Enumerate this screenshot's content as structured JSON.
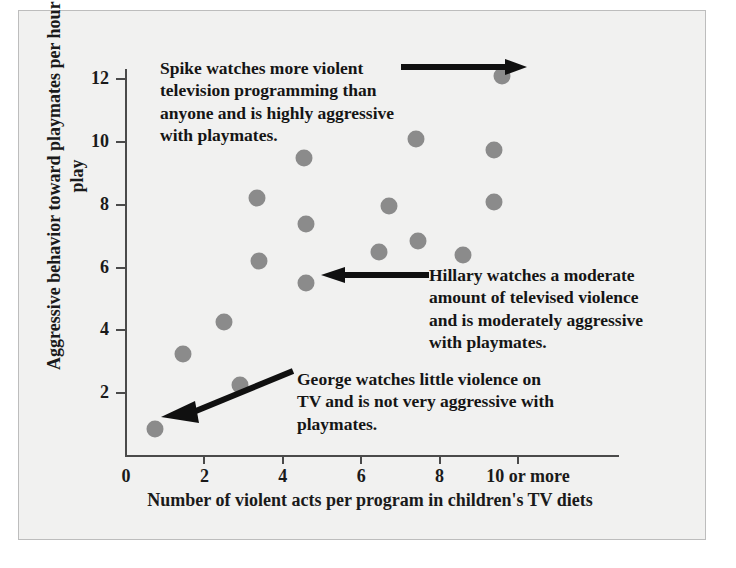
{
  "figure": {
    "background_color": "#f1f1f0",
    "border_color": "#bdbdbd",
    "point_color": "#8b8b8b",
    "axis_color": "#4a4a4a"
  },
  "axes": {
    "y_title": "Aggressive behavior toward playmates\nper hour of play",
    "x_title": "Number of violent acts per program in\nchildren's TV diets",
    "y_ticks": [
      "2",
      "4",
      "6",
      "8",
      "10",
      "12"
    ],
    "x_ticks": [
      "0",
      "2",
      "4",
      "6",
      "8",
      "10 or more"
    ]
  },
  "annotations": {
    "spike": {
      "text": "Spike watches more violent\ntelevision programming than\nanyone and is highly aggressive\nwith playmates.",
      "target_point": "spike-point"
    },
    "hillary": {
      "text": "Hillary watches a moderate\namount of televised violence\nand is moderately aggressive\nwith playmates.",
      "target_point": "hillary-point"
    },
    "george": {
      "text": "George watches little violence on\nTV and is not very aggressive with\nplaymates.",
      "target_point": "george-point"
    }
  },
  "chart_data": {
    "type": "scatter",
    "title": "",
    "xlabel": "Number of violent acts per program in children's TV diets",
    "ylabel": "Aggressive behavior toward playmates per hour of play",
    "xlim": [
      0,
      10.6
    ],
    "ylim": [
      0,
      12.6
    ],
    "xticks": [
      0,
      2,
      4,
      6,
      8,
      10
    ],
    "xticklabels": [
      "0",
      "2",
      "4",
      "6",
      "8",
      "10 or more"
    ],
    "yticks": [
      2,
      4,
      6,
      8,
      10,
      12
    ],
    "yticklabels": [
      "2",
      "4",
      "6",
      "8",
      "10",
      "12"
    ],
    "grid": false,
    "legend": null,
    "marker_color": "#8b8b8b",
    "points": [
      {
        "x": 0.75,
        "y": 0.85,
        "label": "George"
      },
      {
        "x": 1.45,
        "y": 3.25,
        "label": ""
      },
      {
        "x": 2.5,
        "y": 4.25,
        "label": ""
      },
      {
        "x": 2.9,
        "y": 2.25,
        "label": ""
      },
      {
        "x": 3.35,
        "y": 8.2,
        "label": ""
      },
      {
        "x": 3.4,
        "y": 6.2,
        "label": ""
      },
      {
        "x": 4.55,
        "y": 9.5,
        "label": ""
      },
      {
        "x": 4.6,
        "y": 7.4,
        "label": ""
      },
      {
        "x": 4.6,
        "y": 5.5,
        "label": "Hillary"
      },
      {
        "x": 6.45,
        "y": 6.5,
        "label": ""
      },
      {
        "x": 6.7,
        "y": 7.95,
        "label": ""
      },
      {
        "x": 7.4,
        "y": 10.1,
        "label": ""
      },
      {
        "x": 7.45,
        "y": 6.85,
        "label": ""
      },
      {
        "x": 8.6,
        "y": 6.4,
        "label": ""
      },
      {
        "x": 9.4,
        "y": 9.75,
        "label": ""
      },
      {
        "x": 9.4,
        "y": 8.1,
        "label": ""
      },
      {
        "x": 9.6,
        "y": 12.1,
        "label": "Spike"
      }
    ],
    "annotations": [
      {
        "name": "spike",
        "text": "Spike watches more violent television programming than anyone and is highly aggressive with playmates.",
        "points_to": {
          "x": 9.6,
          "y": 12.1
        }
      },
      {
        "name": "hillary",
        "text": "Hillary watches a moderate amount of televised violence and is moderately aggressive with playmates.",
        "points_to": {
          "x": 4.6,
          "y": 5.5
        }
      },
      {
        "name": "george",
        "text": "George watches little violence on TV and is not very aggressive with playmates.",
        "points_to": {
          "x": 0.75,
          "y": 0.85
        }
      }
    ]
  }
}
